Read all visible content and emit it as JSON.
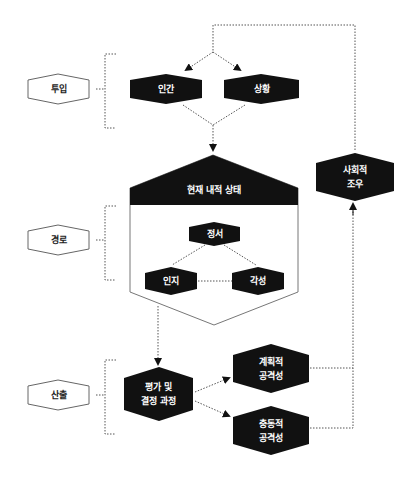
{
  "diagram": {
    "stages": {
      "input": "투입",
      "pathway": "경로",
      "output": "산출"
    },
    "nodes": {
      "person": "인간",
      "situation": "상황",
      "internal_state": "현재 내적 상태",
      "affect": "정서",
      "cognition": "인지",
      "arousal": "각성",
      "appraisal_line1": "평가 및",
      "appraisal_line2": "결정 과정",
      "planned_line1": "계획적",
      "planned_line2": "공격성",
      "impulsive_line1": "충동적",
      "impulsive_line2": "공격성",
      "social_line1": "사회적",
      "social_line2": "조우"
    },
    "colors": {
      "node_fill": "#111111",
      "stage_fill": "#ffffff",
      "line": "#555555"
    }
  }
}
